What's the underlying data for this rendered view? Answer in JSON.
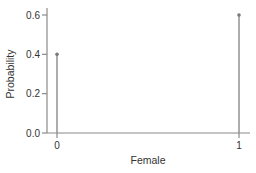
{
  "chart_data": {
    "type": "stem",
    "title": "",
    "xlabel": "Female",
    "ylabel": "Probability",
    "x": [
      0,
      1
    ],
    "categories": [
      "0",
      "1"
    ],
    "values": [
      0.4,
      0.6
    ],
    "xlim": [
      -0.06,
      1.06
    ],
    "ylim": [
      0.0,
      0.64
    ],
    "yticks": [
      0.0,
      0.2,
      0.4,
      0.6
    ],
    "ytick_labels": [
      "0.0",
      "0.2",
      "0.4",
      "0.6"
    ],
    "xticks": [
      0,
      1
    ],
    "xtick_labels": [
      "0",
      "1"
    ],
    "grid": false,
    "legend": null,
    "colors": {
      "stem": "#8a8a8a",
      "marker": "#7a7a7a",
      "axis": "#8a8a8a",
      "text": "#333333"
    }
  }
}
